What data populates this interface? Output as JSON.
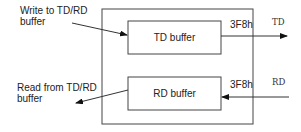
{
  "diagram": {
    "outer_box": {
      "name": "uart-port"
    },
    "td_buffer": {
      "label": "TD buffer",
      "address": "3F8h",
      "signal": "TD"
    },
    "rd_buffer": {
      "label": "RD buffer",
      "address": "3F8h",
      "signal": "RD"
    },
    "write_note": {
      "line1": "Write to TD/RD",
      "line2": "buffer"
    },
    "read_note": {
      "line1": "Read from TD/RD",
      "line2": "buffer"
    }
  }
}
